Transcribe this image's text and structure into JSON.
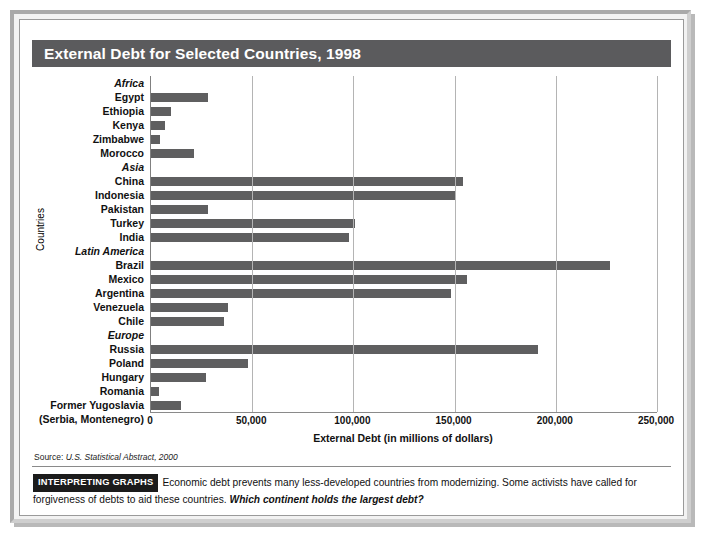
{
  "title": "External Debt for Selected Countries, 1998",
  "source": {
    "prefix": "Source: ",
    "text": "U.S. Statistical Abstract, 2000"
  },
  "caption": {
    "badge": "INTERPRETING GRAPHS",
    "body": "Economic debt prevents many less-developed countries from modernizing. Some activists have called for forgiveness of debts to aid these countries. ",
    "question": "Which continent holds the largest debt?"
  },
  "colors": {
    "bar": "#5f5f60",
    "title_bar": "#5b5b5d",
    "gridline": "#b4b4b4",
    "badge_bg": "#1b1b1b"
  },
  "chart_data": {
    "type": "bar",
    "orientation": "horizontal",
    "title": "External Debt for Selected Countries, 1998",
    "xlabel": "External Debt (in millions of dollars)",
    "ylabel": "Countries",
    "xlim": [
      0,
      250000
    ],
    "xticks": [
      0,
      50000,
      100000,
      150000,
      200000,
      250000
    ],
    "xtick_labels": [
      "0",
      "50,000",
      "100,000",
      "150,000",
      "200,000",
      "250,000"
    ],
    "grid": true,
    "legend": "none",
    "groups": [
      {
        "name": "Africa",
        "items": [
          {
            "label": "Egypt",
            "value": 28000
          },
          {
            "label": "Ethiopia",
            "value": 10000
          },
          {
            "label": "Kenya",
            "value": 7000
          },
          {
            "label": "Zimbabwe",
            "value": 4500
          },
          {
            "label": "Morocco",
            "value": 21000
          }
        ]
      },
      {
        "name": "Asia",
        "items": [
          {
            "label": "China",
            "value": 154000
          },
          {
            "label": "Indonesia",
            "value": 150000
          },
          {
            "label": "Pakistan",
            "value": 28000
          },
          {
            "label": "Turkey",
            "value": 101000
          },
          {
            "label": "India",
            "value": 98000
          }
        ]
      },
      {
        "name": "Latin America",
        "items": [
          {
            "label": "Brazil",
            "value": 227000
          },
          {
            "label": "Mexico",
            "value": 156000
          },
          {
            "label": "Argentina",
            "value": 148000
          },
          {
            "label": "Venezuela",
            "value": 38000
          },
          {
            "label": "Chile",
            "value": 36000
          }
        ]
      },
      {
        "name": "Europe",
        "items": [
          {
            "label": "Russia",
            "value": 191000
          },
          {
            "label": "Poland",
            "value": 48000
          },
          {
            "label": "Hungary",
            "value": 27000
          },
          {
            "label": "Romania",
            "value": 4000
          },
          {
            "label": "Former Yugoslavia",
            "label2": "(Serbia, Montenegro)",
            "value": 15000
          }
        ]
      }
    ]
  }
}
